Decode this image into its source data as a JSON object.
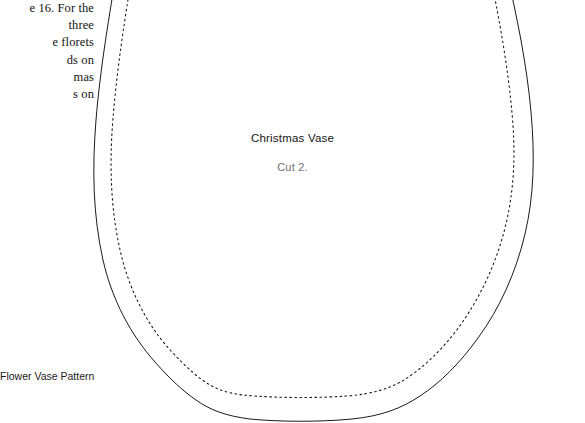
{
  "page": {
    "background_color": "#ffffff",
    "ink_color": "#131313"
  },
  "left_column": {
    "lines": [
      "e 16. For the",
      "three",
      "e florets",
      "ds on",
      "mas",
      "s on",
      ""
    ],
    "text": "e 16. For the\nthree\ne florets\nds on\nmas\ns on\n"
  },
  "caption": {
    "label": "Flower Vase Pattern"
  },
  "pattern": {
    "title": "Christmas Vase",
    "subtitle": "Cut 2.",
    "outline_color": "#1a1a1a",
    "stitch_line_color": "#1a1a1a",
    "outline_stroke_width": "1",
    "stitch_dash": "1.6 3.4"
  }
}
